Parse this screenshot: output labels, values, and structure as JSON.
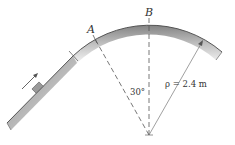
{
  "diagram": {
    "labels": {
      "point_a": "A",
      "point_b": "B",
      "angle": "30°",
      "radius": "ρ = 2.4 m"
    },
    "geometry": {
      "center": [
        149,
        135
      ],
      "radius_px": 111,
      "angle_deg": 30,
      "radius_value": "2.4 m"
    },
    "elements": [
      "curved-track",
      "straight-incline",
      "block",
      "motion-arrow",
      "vertical-dashed-line-B",
      "dashed-line-A",
      "radius-arrow"
    ]
  }
}
